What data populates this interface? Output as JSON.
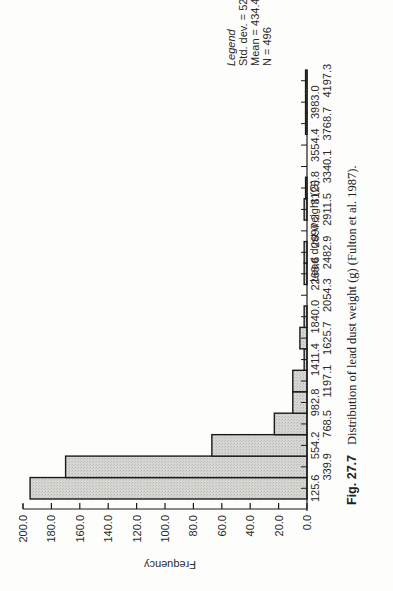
{
  "chart_data": {
    "type": "bar",
    "title": "",
    "xlabel": "Lead dust weight (G)",
    "ylabel": "Frequency",
    "ylim": [
      0,
      200
    ],
    "yticks": [
      "0.0",
      "20.0",
      "40.0",
      "60.0",
      "80.0",
      "100.0",
      "120.0",
      "140.0",
      "160.0",
      "180.0",
      "200.0"
    ],
    "categories": [
      "125.6",
      "339.9",
      "554.2",
      "768.5",
      "982.8",
      "1197.1",
      "1411.4",
      "1625.7",
      "1840.0",
      "2054.3",
      "2268.6",
      "2482.9",
      "2697.2",
      "2911.5",
      "3125.8",
      "3340.1",
      "3554.4",
      "3768.7",
      "3983.0",
      "4197.3"
    ],
    "values": [
      195,
      170,
      67,
      23,
      10,
      10,
      2,
      5,
      2,
      0,
      2,
      2,
      0,
      2,
      1,
      0,
      0,
      1,
      1,
      1
    ],
    "legend": {
      "title": "Legend",
      "lines": [
        "Std. dev. = 524.36",
        "Mean = 434.4",
        "N = 496"
      ]
    },
    "bar_fill": "#d4d4d0",
    "bar_stroke": "#1a1a1a",
    "orientation_note": "page rotated 90 degrees counterclockwise"
  },
  "caption": {
    "label": "Fig. 27.7",
    "text": "Distribution of lead dust weight (g) (Fulton et al. 1987)."
  }
}
